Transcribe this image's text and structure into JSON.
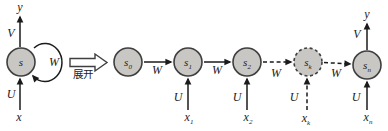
{
  "colors": {
    "background": "#ffffff",
    "node_fill": "#c9c7c4",
    "node_border": "#3f3f3f",
    "line": "#1b1b1b"
  },
  "folded": {
    "output_label": "y",
    "output_weight": "V",
    "state": {
      "base": "s",
      "sub": ""
    },
    "self_loop_weight": "W",
    "input_weight": "U",
    "input_label": "x"
  },
  "unfold": {
    "label": "展开"
  },
  "chain": {
    "states": [
      {
        "base": "s",
        "sub": "0"
      },
      {
        "base": "s",
        "sub": "1"
      },
      {
        "base": "s",
        "sub": "2"
      },
      {
        "base": "s",
        "sub": "k"
      },
      {
        "base": "s",
        "sub": "n"
      }
    ],
    "transition_weights": [
      "W",
      "W",
      "W",
      "W"
    ],
    "inputs": [
      {
        "weight": "U",
        "base": "x",
        "sub": "1"
      },
      {
        "weight": "U",
        "base": "x",
        "sub": "2"
      },
      {
        "weight": "U",
        "base": "x",
        "sub": "k"
      },
      {
        "weight": "U",
        "base": "x",
        "sub": "n"
      }
    ],
    "output": {
      "label": "y",
      "weight": "V"
    }
  }
}
